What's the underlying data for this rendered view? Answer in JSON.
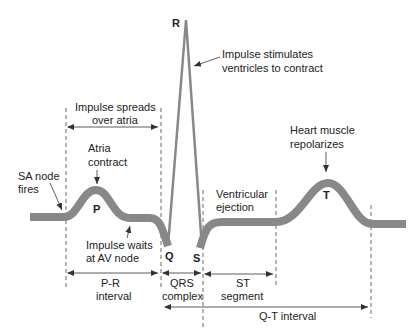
{
  "diagram": {
    "colors": {
      "wave": "#888888",
      "text": "#222222",
      "lines": "#333333"
    },
    "waves": {
      "P": "P",
      "Q": "Q",
      "R": "R",
      "S": "S",
      "T": "T"
    },
    "annotations": {
      "impulse_stimulates_1": "Impulse stimulates",
      "impulse_stimulates_2": "ventricles to contract",
      "impulse_spreads_1": "Impulse spreads",
      "impulse_spreads_2": "over atria",
      "atria_contract_1": "Atria",
      "atria_contract_2": "contract",
      "sa_node_1": "SA node",
      "sa_node_2": "fires",
      "impulse_waits_1": "Impulse waits",
      "impulse_waits_2": "at AV node",
      "heart_muscle_1": "Heart muscle",
      "heart_muscle_2": "repolarizes",
      "ventricular_1": "Ventricular",
      "ventricular_2": "ejection"
    },
    "intervals": {
      "pr_1": "P-R",
      "pr_2": "interval",
      "qrs_1": "QRS",
      "qrs_2": "complex",
      "st_1": "ST",
      "st_2": "segment",
      "qt": "Q-T interval"
    }
  }
}
